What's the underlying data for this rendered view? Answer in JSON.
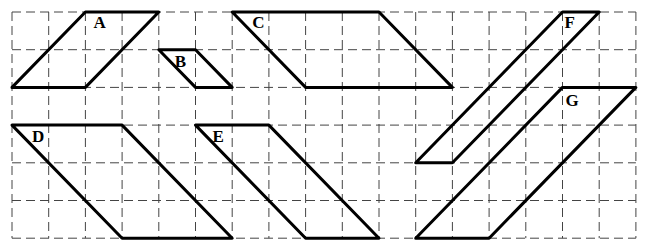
{
  "diagram": {
    "type": "grid-parallelograms",
    "grid": {
      "origin_px": [
        12,
        12
      ],
      "cell_w": 36.7,
      "cell_h": 37.7,
      "cols": 17,
      "rows": 6,
      "line_style": "dashed",
      "line_color": "#444444"
    },
    "shapes": [
      {
        "label": "A",
        "points": [
          [
            2,
            0
          ],
          [
            4,
            0
          ],
          [
            2,
            2
          ],
          [
            0,
            2
          ]
        ],
        "label_offset": [
          8,
          16
        ]
      },
      {
        "label": "B",
        "points": [
          [
            4,
            1
          ],
          [
            5,
            1
          ],
          [
            6,
            2
          ],
          [
            5,
            2
          ]
        ],
        "label_offset": [
          16,
          17
        ]
      },
      {
        "label": "C",
        "points": [
          [
            6,
            0
          ],
          [
            10,
            0
          ],
          [
            12,
            2
          ],
          [
            8,
            2
          ]
        ],
        "label_offset": [
          20,
          16
        ]
      },
      {
        "label": "D",
        "points": [
          [
            0,
            3
          ],
          [
            3,
            3
          ],
          [
            6,
            6
          ],
          [
            3,
            6
          ]
        ],
        "label_offset": [
          20,
          17
        ]
      },
      {
        "label": "E",
        "points": [
          [
            5,
            3
          ],
          [
            7,
            3
          ],
          [
            10,
            6
          ],
          [
            8,
            6
          ]
        ],
        "label_offset": [
          17,
          17
        ]
      },
      {
        "label": "F",
        "points": [
          [
            15,
            0
          ],
          [
            16,
            0
          ],
          [
            12,
            4
          ],
          [
            11,
            4
          ]
        ],
        "label_offset": [
          2,
          16
        ]
      },
      {
        "label": "G",
        "points": [
          [
            15,
            2
          ],
          [
            17,
            2
          ],
          [
            13,
            6
          ],
          [
            11,
            6
          ]
        ],
        "label_offset": [
          3,
          19
        ]
      }
    ],
    "stroke_color": "#000000"
  }
}
